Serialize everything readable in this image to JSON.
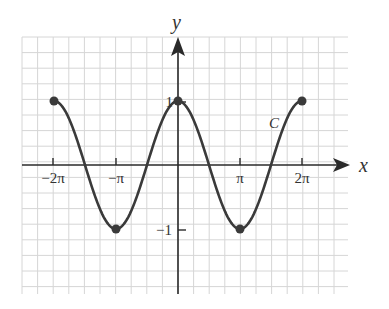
{
  "chart_data": {
    "type": "line",
    "title": "",
    "function": "y = cos x",
    "curve_label": "C",
    "xlabel": "x",
    "ylabel": "y",
    "x_ticks": [
      "−2π",
      "−π",
      "π",
      "2π"
    ],
    "y_ticks": [
      "1",
      "−1"
    ],
    "x_tick_values": [
      -6.2832,
      -3.1416,
      3.1416,
      6.2832
    ],
    "y_tick_values": [
      1,
      -1
    ],
    "xlim": [
      -2.6,
      2.7
    ],
    "ylim": [
      -2,
      2
    ],
    "xlim_note": "in units of π",
    "grid": true,
    "marked_points": [
      {
        "x": "−2π",
        "y": 1
      },
      {
        "x": "−π",
        "y": -1
      },
      {
        "x": "0",
        "y": 1
      },
      {
        "x": "π",
        "y": -1
      },
      {
        "x": "2π",
        "y": 1
      }
    ],
    "domain": [
      "−2π",
      "2π"
    ],
    "colors": {
      "curve": "#3a3a3a",
      "grid": "#d6d6d6",
      "axis": "#2a2a2a"
    }
  }
}
